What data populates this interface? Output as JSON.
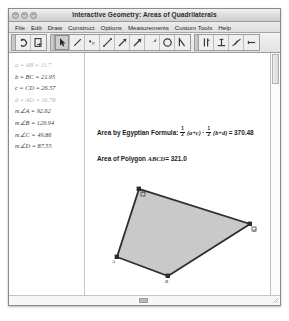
{
  "window": {
    "title": "Interactive Geometry: Areas of Quadrilaterals",
    "traffic_lights": [
      "close",
      "minimize",
      "zoom"
    ]
  },
  "menu": {
    "items": [
      {
        "label": "File"
      },
      {
        "label": "Edit"
      },
      {
        "label": "Draw"
      },
      {
        "label": "Construct"
      },
      {
        "label": "Options"
      },
      {
        "label": "Measurements"
      },
      {
        "label": "Custom Tools"
      },
      {
        "label": "Help"
      }
    ]
  },
  "toolbar": {
    "groups": [
      {
        "name": "history",
        "buttons": [
          {
            "icon": "undo-arrow-icon",
            "selected": false
          },
          {
            "icon": "redo-page-icon",
            "selected": false
          }
        ]
      },
      {
        "name": "drawing",
        "buttons": [
          {
            "icon": "pointer-arrow-icon",
            "selected": true
          },
          {
            "icon": "segment-icon",
            "selected": false
          },
          {
            "icon": "point-p-icon",
            "selected": false
          },
          {
            "icon": "line-icon",
            "selected": false
          },
          {
            "icon": "ray-icon",
            "selected": false
          },
          {
            "icon": "vector-icon",
            "selected": false
          },
          {
            "icon": "filled-vector-icon",
            "selected": false
          },
          {
            "icon": "circle-icon",
            "selected": false
          },
          {
            "icon": "angle-icon",
            "selected": false
          }
        ]
      },
      {
        "name": "constructions",
        "buttons": [
          {
            "icon": "parallel-lines-icon",
            "selected": false
          },
          {
            "icon": "perpendicular-icon",
            "selected": false
          },
          {
            "icon": "midpoint-icon",
            "selected": false
          },
          {
            "icon": "measure-length-icon",
            "selected": false
          }
        ]
      }
    ]
  },
  "measurements": {
    "lines": [
      {
        "text": "a = AB = 11.7",
        "dim": true
      },
      {
        "text": "b = BC = 21.95",
        "dim": false
      },
      {
        "text": "c = CD = 26.57",
        "dim": false
      },
      {
        "text": "d = AD = 16.78",
        "dim": true
      },
      {
        "text": "m∠A = 92.62",
        "dim": false
      },
      {
        "text": "m∠B = 129.94",
        "dim": false
      },
      {
        "text": "m∠C = 49.86",
        "dim": false
      },
      {
        "text": "m∠D = 87.55",
        "dim": false
      }
    ]
  },
  "formulas": {
    "egyptian": {
      "label": "Area by Egyptian Formula:",
      "frac1_num": "1",
      "frac1_den": "2",
      "group1": "(a+c)",
      "operator": "·",
      "frac2_num": "1",
      "frac2_den": "2",
      "group2": "(b+d)",
      "equals": "=",
      "value": "370.48"
    },
    "polygon": {
      "label": "Area of Polygon",
      "name": "ABCD",
      "equals": "=",
      "value": "321.0"
    }
  },
  "figure": {
    "fill_color": "#c9c9c9",
    "stroke_color": "#3a3a3a",
    "vertices": [
      {
        "label": "A",
        "x": 32,
        "y": 204,
        "lx": 29,
        "ly": 209
      },
      {
        "label": "B",
        "x": 83,
        "y": 223,
        "lx": 80,
        "ly": 229
      },
      {
        "label": "C",
        "x": 165,
        "y": 171,
        "lx": 168,
        "ly": 177
      },
      {
        "label": "D",
        "x": 54,
        "y": 136,
        "lx": 57,
        "ly": 139
      }
    ]
  },
  "scrollbars": {
    "vertical_present": true,
    "horizontal_present": true
  }
}
